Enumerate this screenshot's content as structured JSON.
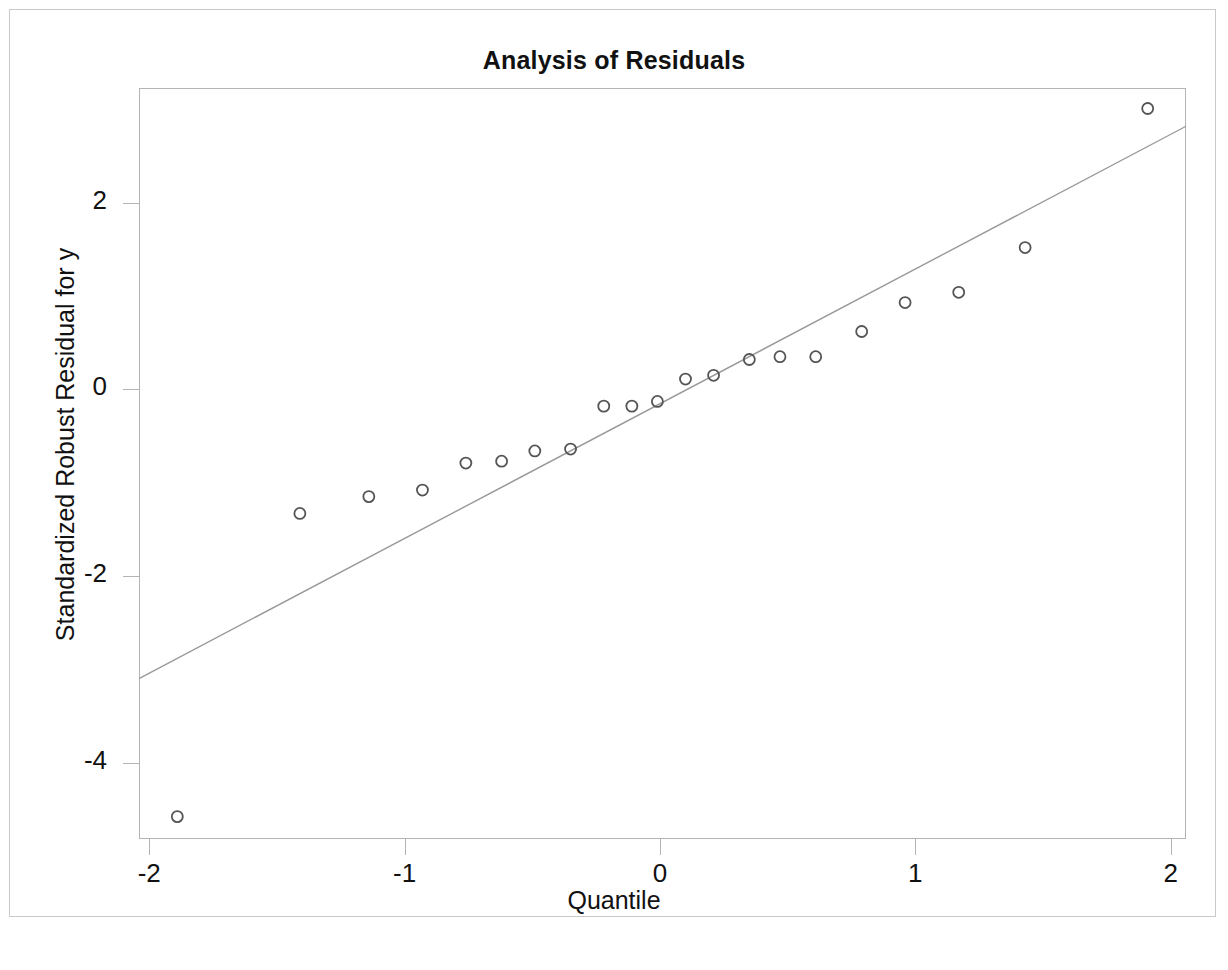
{
  "chart_data": {
    "type": "scatter",
    "title": "Analysis of Residuals",
    "xlabel": "Quantile",
    "ylabel": "Standardized Robust Residual for y",
    "xlim": [
      -2.04,
      2.06
    ],
    "ylim": [
      -4.82,
      3.23
    ],
    "xticks": [
      -2,
      -1,
      0,
      1,
      2
    ],
    "xtick_labels": [
      "-2",
      "-1",
      "0",
      "1",
      "2"
    ],
    "yticks": [
      2,
      0,
      -2,
      -4
    ],
    "ytick_labels": [
      "2",
      "0",
      "-2",
      "-4"
    ],
    "grid": false,
    "legend": null,
    "marker": "open-circle",
    "marker_color": "#555555",
    "marker_size": 11,
    "line_color": "#999999",
    "frame_color": "#b4b4b4",
    "series": [
      {
        "name": "Standardized robust residuals",
        "type": "scatter",
        "x": [
          -1.89,
          -1.41,
          -1.14,
          -0.93,
          -0.76,
          -0.62,
          -0.49,
          -0.35,
          -0.22,
          -0.11,
          -0.01,
          0.1,
          0.21,
          0.35,
          0.47,
          0.61,
          0.79,
          0.96,
          1.17,
          1.43,
          1.91
        ],
        "y": [
          -4.58,
          -1.33,
          -1.15,
          -1.08,
          -0.79,
          -0.77,
          -0.66,
          -0.64,
          -0.18,
          -0.18,
          -0.13,
          0.11,
          0.15,
          0.32,
          0.35,
          0.35,
          0.62,
          0.93,
          1.04,
          1.52,
          3.01
        ]
      },
      {
        "name": "Reference line",
        "type": "line",
        "x": [
          -2.04,
          2.06
        ],
        "y": [
          -3.1,
          2.82
        ]
      }
    ]
  },
  "figure": {
    "title": "Analysis of Residuals",
    "x_axis_title": "Quantile",
    "y_axis_title": "Standardized Robust Residual for y"
  }
}
